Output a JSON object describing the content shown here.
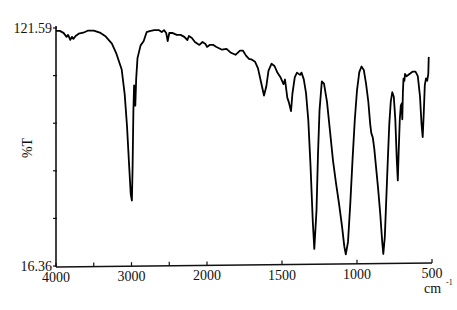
{
  "chart_data": {
    "type": "line",
    "title": "",
    "xlabel": "cm-1",
    "xlabel_main": "cm",
    "xlabel_sup": "-1",
    "ylabel": "%T",
    "xlim": [
      4000,
      500
    ],
    "ylim": [
      16.36,
      121.59
    ],
    "x_axis_scale": "split: 4000-2000 compressed, 2000-500 expanded (2x)",
    "x_ticks": [
      4000,
      3500,
      3000,
      2500,
      2000,
      1500,
      1000,
      500
    ],
    "x_tick_labels": [
      "4000",
      "3000",
      "2000",
      "1500",
      "1000",
      "500"
    ],
    "x_labeled_values": [
      4000,
      3000,
      2000,
      1500,
      1000,
      500
    ],
    "y_ticks": [
      121.59,
      100.54,
      79.49,
      58.45,
      37.4,
      16.36
    ],
    "y_tick_labels": [
      "121.59",
      "16.36"
    ],
    "y_labeled_values": [
      121.59,
      16.36
    ],
    "grid": false,
    "legend": "none",
    "series": [
      {
        "name": "spectrum",
        "color": "#000000",
        "points": [
          [
            4000,
            120.3
          ],
          [
            3950,
            120.3
          ],
          [
            3900,
            119.4
          ],
          [
            3860,
            117.6
          ],
          [
            3840,
            118.5
          ],
          [
            3810,
            116.3
          ],
          [
            3790,
            117.6
          ],
          [
            3770,
            116.7
          ],
          [
            3740,
            118.0
          ],
          [
            3700,
            119.0
          ],
          [
            3640,
            119.4
          ],
          [
            3580,
            120.3
          ],
          [
            3500,
            120.3
          ],
          [
            3420,
            119.4
          ],
          [
            3340,
            117.6
          ],
          [
            3260,
            114.5
          ],
          [
            3200,
            110.0
          ],
          [
            3130,
            103.0
          ],
          [
            3090,
            92.0
          ],
          [
            3060,
            78.0
          ],
          [
            3030,
            60.0
          ],
          [
            3010,
            48.0
          ],
          [
            2995,
            45.0
          ],
          [
            2985,
            60.0
          ],
          [
            2975,
            85.0
          ],
          [
            2965,
            96.0
          ],
          [
            2950,
            87.0
          ],
          [
            2938,
            99.0
          ],
          [
            2920,
            108.0
          ],
          [
            2880,
            113.6
          ],
          [
            2840,
            115.4
          ],
          [
            2800,
            119.4
          ],
          [
            2760,
            119.9
          ],
          [
            2700,
            120.3
          ],
          [
            2640,
            120.3
          ],
          [
            2600,
            119.4
          ],
          [
            2570,
            120.3
          ],
          [
            2540,
            119.0
          ],
          [
            2520,
            115.4
          ],
          [
            2500,
            119.0
          ],
          [
            2460,
            119.0
          ],
          [
            2400,
            118.1
          ],
          [
            2350,
            118.1
          ],
          [
            2300,
            117.2
          ],
          [
            2260,
            115.8
          ],
          [
            2240,
            117.6
          ],
          [
            2200,
            116.7
          ],
          [
            2160,
            114.9
          ],
          [
            2120,
            114.0
          ],
          [
            2100,
            113.6
          ],
          [
            2060,
            114.9
          ],
          [
            2020,
            114.0
          ],
          [
            2000,
            112.7
          ],
          [
            1980,
            113.6
          ],
          [
            1960,
            113.6
          ],
          [
            1940,
            112.7
          ],
          [
            1900,
            111.4
          ],
          [
            1870,
            111.8
          ],
          [
            1840,
            110.0
          ],
          [
            1810,
            109.1
          ],
          [
            1780,
            110.9
          ],
          [
            1760,
            110.9
          ],
          [
            1740,
            108.7
          ],
          [
            1720,
            107.3
          ],
          [
            1700,
            106.9
          ],
          [
            1680,
            106.0
          ],
          [
            1660,
            103.0
          ],
          [
            1640,
            97.0
          ],
          [
            1620,
            91.0
          ],
          [
            1605,
            95.0
          ],
          [
            1590,
            102.0
          ],
          [
            1570,
            105.0
          ],
          [
            1550,
            104.0
          ],
          [
            1530,
            101.0
          ],
          [
            1510,
            99.0
          ],
          [
            1490,
            96.0
          ],
          [
            1480,
            98.0
          ],
          [
            1465,
            90.0
          ],
          [
            1455,
            88.0
          ],
          [
            1440,
            84.0
          ],
          [
            1430,
            92.0
          ],
          [
            1415,
            99.0
          ],
          [
            1400,
            101.0
          ],
          [
            1380,
            100.0
          ],
          [
            1370,
            101.0
          ],
          [
            1355,
            98.0
          ],
          [
            1340,
            92.0
          ],
          [
            1325,
            80.0
          ],
          [
            1310,
            60.0
          ],
          [
            1295,
            35.0
          ],
          [
            1285,
            23.0
          ],
          [
            1270,
            40.0
          ],
          [
            1260,
            65.0
          ],
          [
            1250,
            84.0
          ],
          [
            1235,
            97.0
          ],
          [
            1220,
            96.0
          ],
          [
            1200,
            88.0
          ],
          [
            1180,
            75.0
          ],
          [
            1160,
            62.0
          ],
          [
            1140,
            52.0
          ],
          [
            1120,
            43.0
          ],
          [
            1100,
            33.0
          ],
          [
            1085,
            24.0
          ],
          [
            1075,
            20.5
          ],
          [
            1060,
            26.0
          ],
          [
            1045,
            43.0
          ],
          [
            1030,
            62.0
          ],
          [
            1015,
            80.0
          ],
          [
            1000,
            93.0
          ],
          [
            985,
            101.0
          ],
          [
            970,
            103.5
          ],
          [
            955,
            102.0
          ],
          [
            940,
            96.0
          ],
          [
            925,
            88.0
          ],
          [
            912,
            78.0
          ],
          [
            905,
            74.0
          ],
          [
            895,
            72.0
          ],
          [
            885,
            67.0
          ],
          [
            875,
            60.0
          ],
          [
            860,
            50.0
          ],
          [
            845,
            38.0
          ],
          [
            832,
            26.0
          ],
          [
            825,
            20.5
          ],
          [
            815,
            28.0
          ],
          [
            805,
            45.0
          ],
          [
            795,
            62.0
          ],
          [
            785,
            78.0
          ],
          [
            775,
            88.0
          ],
          [
            765,
            92.0
          ],
          [
            755,
            90.0
          ],
          [
            745,
            80.0
          ],
          [
            735,
            62.0
          ],
          [
            728,
            53.0
          ],
          [
            722,
            66.0
          ],
          [
            715,
            80.0
          ],
          [
            708,
            86.0
          ],
          [
            702,
            87.0
          ],
          [
            698,
            80.0
          ],
          [
            694,
            92.0
          ],
          [
            690,
            98.0
          ],
          [
            684,
            97.0
          ],
          [
            680,
            100.0
          ],
          [
            670,
            99.0
          ],
          [
            650,
            100.0
          ],
          [
            630,
            101.0
          ],
          [
            610,
            101.0
          ],
          [
            595,
            99.0
          ],
          [
            580,
            90.0
          ],
          [
            570,
            78.0
          ],
          [
            562,
            72.0
          ],
          [
            555,
            83.0
          ],
          [
            548,
            95.0
          ],
          [
            540,
            98.0
          ],
          [
            532,
            97.0
          ],
          [
            525,
            100.0
          ],
          [
            522,
            107.0
          ],
          [
            520,
            107.5
          ]
        ]
      }
    ]
  }
}
